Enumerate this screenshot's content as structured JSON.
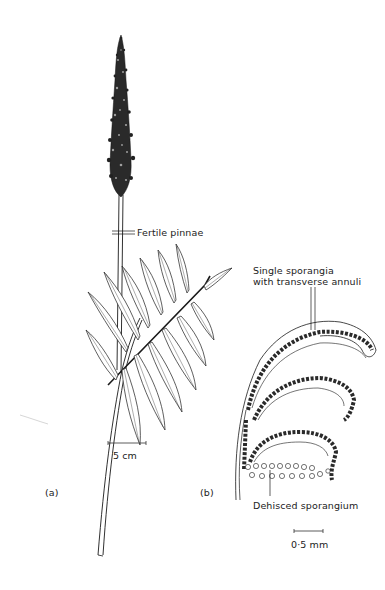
{
  "figure": {
    "panel_a": {
      "label": "(a)",
      "annotation": "Fertile pinnae",
      "scale_bar": "5 cm"
    },
    "panel_b": {
      "label": "(b)",
      "annotation_top_line1": "Single sporangia",
      "annotation_top_line2": "with transverse annuli",
      "annotation_bottom": "Dehisced sporangium",
      "scale_bar": "0·5 mm"
    },
    "colors": {
      "ink": "#1a1a1a",
      "paper": "#ffffff"
    }
  }
}
